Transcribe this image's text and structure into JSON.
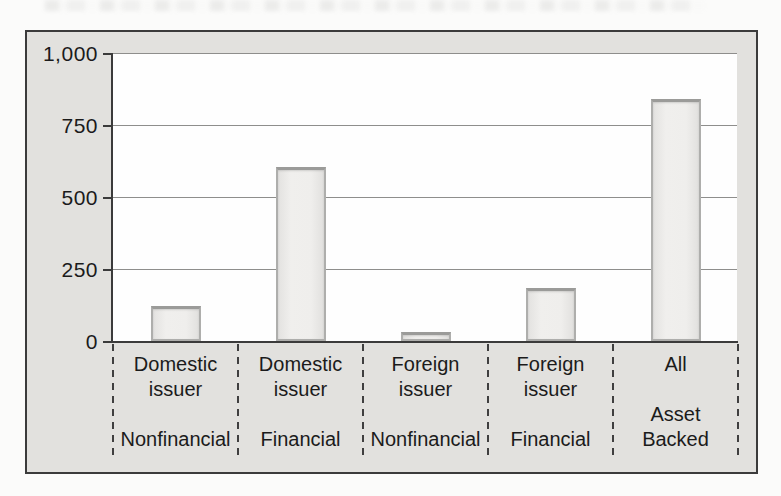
{
  "figure": {
    "kind": "scanned-textbook-bar-chart",
    "colors": {
      "figure_bg": "#e2e1de",
      "plot_bg": "#fefefe",
      "bar_fill": "#efeeec",
      "bar_border": "#aeaeac",
      "gridline": "#8e8e8c",
      "axis": "#3b3b3b",
      "text": "#1b1b1b",
      "page_bg": "#fbfbfa"
    }
  },
  "chart_data": {
    "type": "bar",
    "title": "",
    "xlabel": "",
    "ylabel": "",
    "ylim": [
      0,
      1000
    ],
    "ytick_interval": 250,
    "grid": true,
    "legend": false,
    "yticks": [
      "1,000",
      "750",
      "500",
      "250",
      "0"
    ],
    "categories": [
      {
        "issuer_lines": [
          "Domestic",
          "issuer"
        ],
        "sector_lines": [
          "Nonfinancial"
        ]
      },
      {
        "issuer_lines": [
          "Domestic",
          "issuer"
        ],
        "sector_lines": [
          "Financial"
        ]
      },
      {
        "issuer_lines": [
          "Foreign",
          "issuer"
        ],
        "sector_lines": [
          "Nonfinancial"
        ]
      },
      {
        "issuer_lines": [
          "Foreign",
          "issuer"
        ],
        "sector_lines": [
          "Financial"
        ]
      },
      {
        "issuer_lines": [
          "All"
        ],
        "sector_lines": [
          "Asset",
          "Backed"
        ]
      }
    ],
    "values": [
      120,
      605,
      30,
      185,
      840
    ]
  }
}
